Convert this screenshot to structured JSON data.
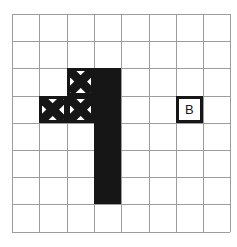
{
  "figure": {
    "type": "grid-puzzle-diagram",
    "background_color": "#ffffff",
    "grid": {
      "columns": 8,
      "rows": 8,
      "origin_x": 12,
      "origin_y": 14,
      "cell_width": 27.3,
      "cell_height": 27.2,
      "line_color": "#9c9c9c",
      "line_width": 1
    },
    "ink_color": "#161616",
    "shapes": [
      {
        "name": "x-square-top",
        "kind": "x-marked-square",
        "col": 2,
        "row": 2,
        "col_span": 1,
        "row_span": 1
      },
      {
        "name": "x-square-left",
        "kind": "x-marked-square",
        "col": 1,
        "row": 3,
        "col_span": 1,
        "row_span": 1
      },
      {
        "name": "x-square-middle",
        "kind": "x-marked-square",
        "col": 2,
        "row": 3,
        "col_span": 1,
        "row_span": 1
      },
      {
        "name": "black-bar",
        "kind": "filled-rectangle",
        "col": 3,
        "row": 2,
        "col_span": 1,
        "row_span": 5
      },
      {
        "name": "labeled-square-b",
        "kind": "labeled-square",
        "col": 6,
        "row": 3,
        "col_span": 1,
        "row_span": 1,
        "label": "B"
      }
    ]
  }
}
